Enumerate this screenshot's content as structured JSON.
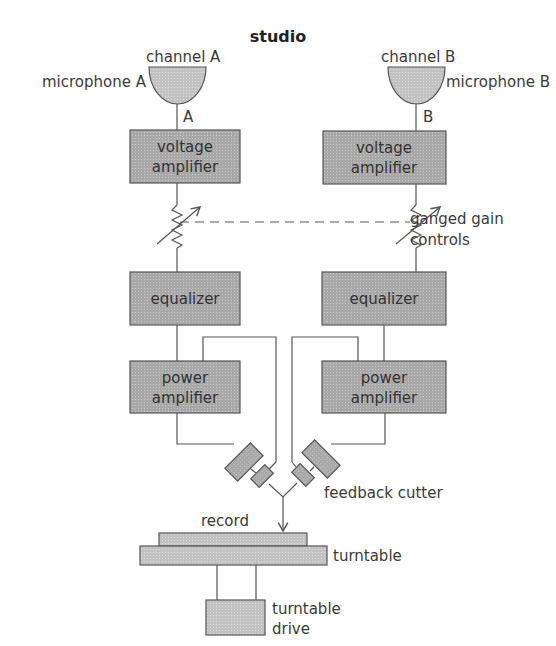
{
  "title": "studio",
  "channels": [
    {
      "channel_label": "channel A",
      "microphone_label": "microphone A",
      "line_label": "A",
      "voltage_amplifier": [
        "voltage",
        "amplifier"
      ],
      "equalizer": "equalizer",
      "power_amplifier": [
        "power",
        "amplifier"
      ]
    },
    {
      "channel_label": "channel B",
      "microphone_label": "microphone B",
      "line_label": "B",
      "voltage_amplifier": [
        "voltage",
        "amplifier"
      ],
      "equalizer": "equalizer",
      "power_amplifier": [
        "power",
        "amplifier"
      ]
    }
  ],
  "gain_controls_label": [
    "ganged gain",
    "controls"
  ],
  "feedback_cutter_label": "feedback cutter",
  "record_label": "record",
  "turntable_label": "turntable",
  "turntable_drive_label": [
    "turntable",
    "drive"
  ],
  "colors": {
    "block_fill": "#a9a9a9",
    "light_fill": "#c4c4c4",
    "line": "#555555",
    "text": "#3a3a3a"
  }
}
